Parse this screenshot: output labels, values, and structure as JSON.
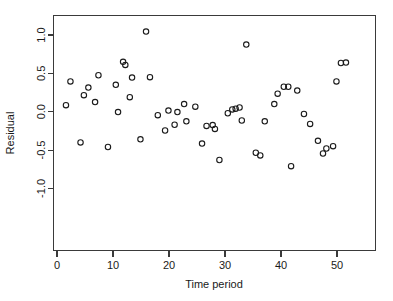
{
  "chart_data": {
    "type": "scatter",
    "title": "",
    "xlabel": "Time period",
    "ylabel": "Residual",
    "xlim": [
      -1.5,
      55.0
    ],
    "ylim": [
      -1.28,
      1.22
    ],
    "xticks": [
      0,
      10,
      20,
      30,
      40,
      50
    ],
    "xtick_labels": [
      "0",
      "10",
      "20",
      "30",
      "40",
      "50"
    ],
    "yticks": [
      -1.0,
      -0.5,
      0.0,
      0.5,
      1.0
    ],
    "ytick_labels": [
      "-1.0",
      "-0.5",
      "0.0",
      "0.5",
      "1.0"
    ],
    "grid": false,
    "legend": null,
    "marker": "open-circle",
    "marker_color": "#1a1a1a",
    "x": [
      1.6,
      2.4,
      4.2,
      4.8,
      5.6,
      6.8,
      7.4,
      9.1,
      10.5,
      10.9,
      11.8,
      12.2,
      13.0,
      13.4,
      14.9,
      15.9,
      16.6,
      18.0,
      19.3,
      19.9,
      21.0,
      21.5,
      22.7,
      23.1,
      24.7,
      25.9,
      26.7,
      27.8,
      28.2,
      29.0,
      30.5,
      31.3,
      31.9,
      32.6,
      33.0,
      33.8,
      35.5,
      36.3,
      37.1,
      38.8,
      39.4,
      40.5,
      41.3,
      41.8,
      42.9,
      44.1,
      45.2,
      46.6,
      47.5,
      48.1,
      49.3,
      49.9,
      50.7,
      51.6
    ],
    "y": [
      0.085,
      0.395,
      -0.4,
      0.215,
      0.315,
      0.125,
      0.475,
      -0.46,
      0.35,
      -0.005,
      0.65,
      0.61,
      0.19,
      0.445,
      -0.36,
      1.045,
      0.45,
      -0.045,
      -0.245,
      0.015,
      -0.17,
      -0.005,
      0.1,
      -0.125,
      0.065,
      -0.415,
      -0.185,
      -0.175,
      -0.225,
      -0.63,
      -0.02,
      0.03,
      0.04,
      0.055,
      -0.115,
      0.875,
      -0.535,
      -0.57,
      -0.125,
      0.1,
      0.235,
      0.325,
      0.325,
      -0.71,
      0.275,
      -0.03,
      -0.16,
      -0.38,
      -0.545,
      -0.48,
      -0.45,
      0.395,
      0.635,
      0.64
    ],
    "points": [
      {
        "x": 1.6,
        "y": 0.085
      },
      {
        "x": 2.4,
        "y": 0.395
      },
      {
        "x": 4.2,
        "y": -0.4
      },
      {
        "x": 4.8,
        "y": 0.215
      },
      {
        "x": 5.6,
        "y": 0.315
      },
      {
        "x": 6.8,
        "y": 0.125
      },
      {
        "x": 7.4,
        "y": 0.475
      },
      {
        "x": 9.1,
        "y": -0.46
      },
      {
        "x": 10.5,
        "y": 0.35
      },
      {
        "x": 10.9,
        "y": -0.005
      },
      {
        "x": 11.8,
        "y": 0.65
      },
      {
        "x": 12.2,
        "y": 0.61
      },
      {
        "x": 13.0,
        "y": 0.19
      },
      {
        "x": 13.4,
        "y": 0.445
      },
      {
        "x": 14.9,
        "y": -0.36
      },
      {
        "x": 15.9,
        "y": 1.045
      },
      {
        "x": 16.6,
        "y": 0.45
      },
      {
        "x": 18.0,
        "y": -0.045
      },
      {
        "x": 19.3,
        "y": -0.245
      },
      {
        "x": 19.9,
        "y": 0.015
      },
      {
        "x": 21.0,
        "y": -0.17
      },
      {
        "x": 21.5,
        "y": -0.005
      },
      {
        "x": 22.7,
        "y": 0.1
      },
      {
        "x": 23.1,
        "y": -0.125
      },
      {
        "x": 24.7,
        "y": 0.065
      },
      {
        "x": 25.9,
        "y": -0.415
      },
      {
        "x": 26.7,
        "y": -0.185
      },
      {
        "x": 27.8,
        "y": -0.175
      },
      {
        "x": 28.2,
        "y": -0.225
      },
      {
        "x": 29.0,
        "y": -0.63
      },
      {
        "x": 30.5,
        "y": -0.02
      },
      {
        "x": 31.3,
        "y": 0.03
      },
      {
        "x": 31.9,
        "y": 0.04
      },
      {
        "x": 32.6,
        "y": 0.055
      },
      {
        "x": 33.0,
        "y": -0.115
      },
      {
        "x": 33.8,
        "y": 0.875
      },
      {
        "x": 35.5,
        "y": -0.535
      },
      {
        "x": 36.3,
        "y": -0.57
      },
      {
        "x": 37.1,
        "y": -0.125
      },
      {
        "x": 38.8,
        "y": 0.1
      },
      {
        "x": 39.4,
        "y": 0.235
      },
      {
        "x": 40.5,
        "y": 0.325
      },
      {
        "x": 41.3,
        "y": 0.325
      },
      {
        "x": 41.8,
        "y": -0.71
      },
      {
        "x": 42.9,
        "y": 0.275
      },
      {
        "x": 44.1,
        "y": -0.03
      },
      {
        "x": 45.2,
        "y": -0.16
      },
      {
        "x": 46.6,
        "y": -0.38
      },
      {
        "x": 47.5,
        "y": -0.545
      },
      {
        "x": 48.1,
        "y": -0.48
      },
      {
        "x": 49.3,
        "y": -0.45
      },
      {
        "x": 49.9,
        "y": 0.395
      },
      {
        "x": 50.7,
        "y": 0.635
      },
      {
        "x": 51.6,
        "y": 0.64
      }
    ]
  },
  "axes": {
    "x_title": "Time period",
    "y_title": "Residual",
    "x_tick_labels": [
      "0",
      "10",
      "20",
      "30",
      "40",
      "50"
    ],
    "y_tick_labels": [
      "1.0",
      "0.5",
      "0.0",
      "-0.5",
      "-1.0"
    ]
  },
  "style": {
    "axis_color": "#3a3a3a",
    "marker_color": "#1a1a1a",
    "background": "#ffffff"
  }
}
